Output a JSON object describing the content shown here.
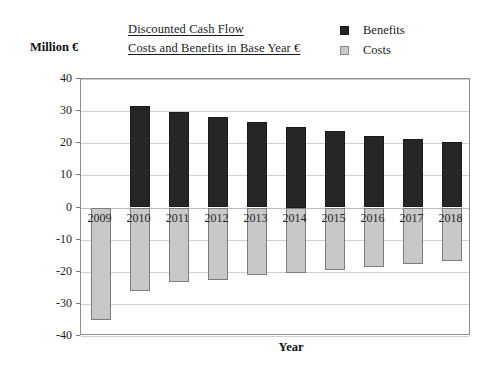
{
  "chart_data": {
    "type": "bar",
    "title": "Discounted Cash Flow Costs and Benefits in Base Year €",
    "title_lines": [
      "Discounted Cash Flow",
      "Costs and Benefits in Base Year €"
    ],
    "xlabel": "Year",
    "ylabel": "Million €",
    "ylim": [
      -40,
      40
    ],
    "yticks": [
      40,
      30,
      20,
      10,
      0,
      -10,
      -20,
      -30,
      -40
    ],
    "ytick_labels": [
      "40",
      "30",
      "20",
      "10",
      "0",
      "-10",
      "-20",
      "-30",
      "-40"
    ],
    "grid": true,
    "legend_position": "top-right",
    "categories": [
      "2009",
      "2010",
      "2011",
      "2012",
      "2013",
      "2014",
      "2015",
      "2016",
      "2017",
      "2018"
    ],
    "series": [
      {
        "name": "Benefits",
        "color": "#262626",
        "values": [
          0,
          31.5,
          29.7,
          28.2,
          26.5,
          25.0,
          23.7,
          22.3,
          21.2,
          20.3
        ]
      },
      {
        "name": "Costs",
        "color": "#c8c8c8",
        "values": [
          -35.0,
          -26.0,
          -23.2,
          -22.5,
          -21.0,
          -20.5,
          -19.3,
          -18.6,
          -17.6,
          -16.6
        ]
      }
    ]
  },
  "legend": {
    "items": [
      {
        "label": "Benefits",
        "swatch": "benefits"
      },
      {
        "label": "Costs",
        "swatch": "costs"
      }
    ]
  }
}
